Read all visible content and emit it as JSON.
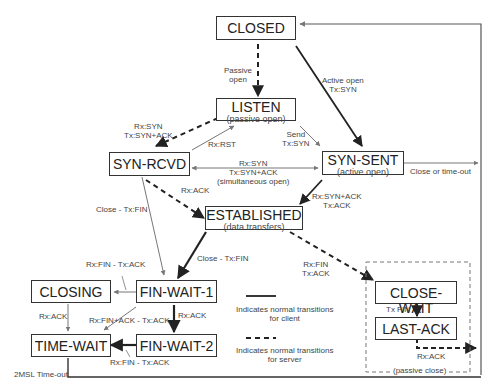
{
  "diagram": {
    "type": "state-machine",
    "states": {
      "closed": {
        "name": "CLOSED"
      },
      "listen": {
        "name": "LISTEN",
        "sub": "(passive open)"
      },
      "syn_rcvd": {
        "name": "SYN-RCVD"
      },
      "syn_sent": {
        "name": "SYN-SENT",
        "sub": "(active open)"
      },
      "established": {
        "name": "ESTABLISHED",
        "sub": "(data transfers)"
      },
      "fin_wait_1": {
        "name": "FIN-WAIT-1"
      },
      "fin_wait_2": {
        "name": "FIN-WAIT-2"
      },
      "closing": {
        "name": "CLOSING"
      },
      "time_wait": {
        "name": "TIME-WAIT"
      },
      "close_wait": {
        "name": "CLOSE-WAIT"
      },
      "last_ack": {
        "name": "LAST-ACK"
      }
    },
    "transitions": {
      "passive_open": {
        "l1": "Passive",
        "l2": "open"
      },
      "active_open": {
        "l1": "Active open",
        "l2": "Tx:SYN"
      },
      "listen_to_synrcvd": {
        "l1": "Rx:SYN",
        "l2": "Tx:SYN+ACK"
      },
      "rst": {
        "l1": "Rx:RST"
      },
      "send": {
        "l1": "Send",
        "l2": "Tx:SYN"
      },
      "simultaneous": {
        "l1": "Rx:SYN",
        "l2": "Tx:SYN+ACK",
        "l3": "(simultaneous open)"
      },
      "close_timeout": {
        "l1": "Close or time-out"
      },
      "synrcvd_ack": {
        "l1": "Rx:ACK"
      },
      "synsent_established": {
        "l1": "Rx:SYN+ACK",
        "l2": "Tx:ACK"
      },
      "synrcvd_close": {
        "l1": "Close - Tx:FIN"
      },
      "established_close": {
        "l1": "Close - Tx:FIN"
      },
      "established_fin": {
        "l1": "Rx:FIN",
        "l2": "Tx:ACK"
      },
      "fw1_closing": {
        "l1": "Rx:FIN - Tx:ACK"
      },
      "closing_ack": {
        "l1": "Rx:ACK"
      },
      "fw1_finack": {
        "l1": "Rx:FIN+ACK - Tx:ACK"
      },
      "fw1_ack": {
        "l1": "Rx:ACK"
      },
      "fw2_fin": {
        "l1": "Rx:FIN - Tx:ACK"
      },
      "timeout_2msl": {
        "l1": "2MSL Time-out"
      },
      "tx_fin": {
        "l1": "Tx FIN"
      },
      "lastack_ack": {
        "l1": "Rx:ACK"
      }
    },
    "passive_close_label": "(passive close)",
    "legend": {
      "solid": {
        "l1": "Indicates normal transitions",
        "l2": "for client"
      },
      "dashed": {
        "l1": "Indicates normal transitions",
        "l2": "for server"
      }
    },
    "colors": {
      "line": "#222222",
      "thin_line": "#777777",
      "box_border": "#333333",
      "text": "#222222"
    }
  }
}
